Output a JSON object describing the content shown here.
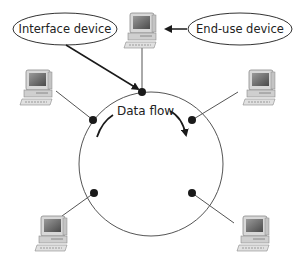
{
  "diagram": {
    "labels": {
      "interface_device": "Interface device",
      "end_use_device": "End-use device",
      "data_flow": "Data flow"
    },
    "colors": {
      "line": "#555555",
      "node": "#1a1a1a",
      "text": "#222222",
      "monitor_body": "#d4d4d4",
      "screen": "#7a7a7a"
    },
    "ring": {
      "cx": 151,
      "cy": 164,
      "r": 72
    },
    "nodes": [
      {
        "id": "top",
        "x": 142,
        "y": 92,
        "computer_x": 151,
        "computer_y": 25
      },
      {
        "id": "upper-left",
        "x": 93,
        "y": 120,
        "computer_x": 40,
        "computer_y": 88
      },
      {
        "id": "upper-right",
        "x": 192,
        "y": 120,
        "computer_x": 262,
        "computer_y": 88
      },
      {
        "id": "lower-left",
        "x": 94,
        "y": 193,
        "computer_x": 52,
        "computer_y": 232
      },
      {
        "id": "lower-right",
        "x": 192,
        "y": 193,
        "computer_x": 253,
        "computer_y": 232
      }
    ]
  }
}
